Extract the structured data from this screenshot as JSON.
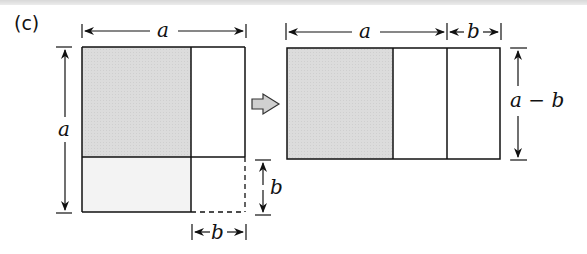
{
  "figure": {
    "part_label": "(c)",
    "left": {
      "top_dimension": "a",
      "left_dimension": "a",
      "right_dimension": "b",
      "bottom_dimension": "b"
    },
    "arrow": "right-arrow",
    "right": {
      "top_dimension_a": "a",
      "top_dimension_b": "b",
      "right_dimension": "a − b"
    },
    "colors": {
      "shaded": "#dcdcdc",
      "light": "#f2f2f2",
      "line": "#111111",
      "arrow_fill": "#d0d0d0"
    }
  }
}
